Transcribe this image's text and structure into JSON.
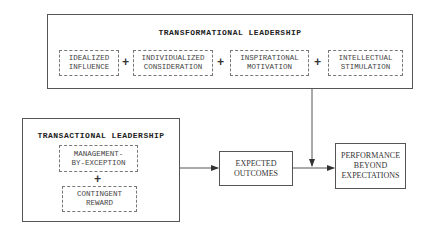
{
  "transformational": {
    "title": "TRANSFORMATIONAL LEADERSHIP",
    "components": [
      {
        "label": "IDEALIZED\nINFLUENCE"
      },
      {
        "label": "INDIVIDUALIZED\nCONSIDERATION"
      },
      {
        "label": "INSPIRATIONAL\nMOTIVATION"
      },
      {
        "label": "INTELLECTUAL\nSTIMULATION"
      }
    ],
    "operator": "+"
  },
  "transactional": {
    "title": "TRANSACTIONAL LEADERSHIP",
    "components": [
      {
        "label": "MANAGEMENT-\nBY-EXCEPTION"
      },
      {
        "label": "CONTINGENT\nREWARD"
      }
    ],
    "operator": "+"
  },
  "outcomes": {
    "expected": "EXPECTED\nOUTCOMES",
    "performance": "PERFORMANCE\nBEYOND\nEXPECTATIONS"
  }
}
